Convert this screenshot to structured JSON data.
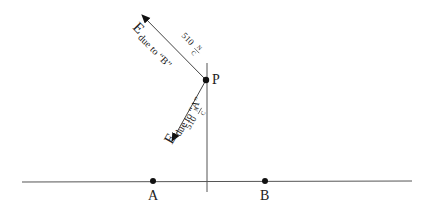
{
  "diagram": {
    "points": {
      "A": {
        "label": "A",
        "x": 153,
        "y": 181
      },
      "B": {
        "label": "B",
        "x": 265,
        "y": 181
      },
      "P": {
        "label": "P",
        "x": 206,
        "y": 80
      }
    },
    "vectors": [
      {
        "name": "E due to B",
        "symbol": "E",
        "subscript": "due to “B”",
        "magnitude": "510",
        "unit_num": "N",
        "unit_den": "C"
      },
      {
        "name": "E due to A",
        "symbol": "E",
        "subscript": "due to “A”",
        "magnitude": "510",
        "unit_num": "N",
        "unit_den": "C"
      }
    ],
    "colors": {
      "line": "#555555",
      "dot": "#111111"
    }
  }
}
